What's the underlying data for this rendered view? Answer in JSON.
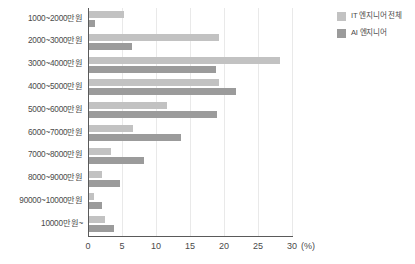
{
  "chart_data": {
    "type": "bar",
    "orientation": "horizontal",
    "title": "",
    "subtitle": "",
    "xlabel": "(%)",
    "ylabel": "",
    "xlim": [
      0,
      30
    ],
    "xticks": [
      0,
      5,
      10,
      15,
      20,
      25,
      30
    ],
    "xtick_labels": [
      "0",
      "5",
      "10",
      "15",
      "20",
      "25",
      "30"
    ],
    "grid": true,
    "grid_axis": "x",
    "legend_position": "top-right",
    "categories": [
      "1000~2000만원",
      "2000~3000만원",
      "3000~4000만원",
      "4000~5000만원",
      "5000~6000만원",
      "6000~7000만원",
      "7000~8000만원",
      "8000~9000만원",
      "90000~10000만원",
      "10000만원~"
    ],
    "series": [
      {
        "name": "IT 엔지니어 전체",
        "color": "#c2c2c2",
        "values": [
          5.3,
          19.3,
          28.3,
          19.3,
          11.6,
          6.6,
          3.4,
          2.1,
          0.9,
          2.5
        ]
      },
      {
        "name": "AI 엔지니어",
        "color": "#9b9b9b",
        "values": [
          1.1,
          6.4,
          18.8,
          21.8,
          19.0,
          13.7,
          8.2,
          4.7,
          2.0,
          3.8
        ]
      }
    ]
  },
  "axis": {
    "unit_label": "(%)"
  }
}
